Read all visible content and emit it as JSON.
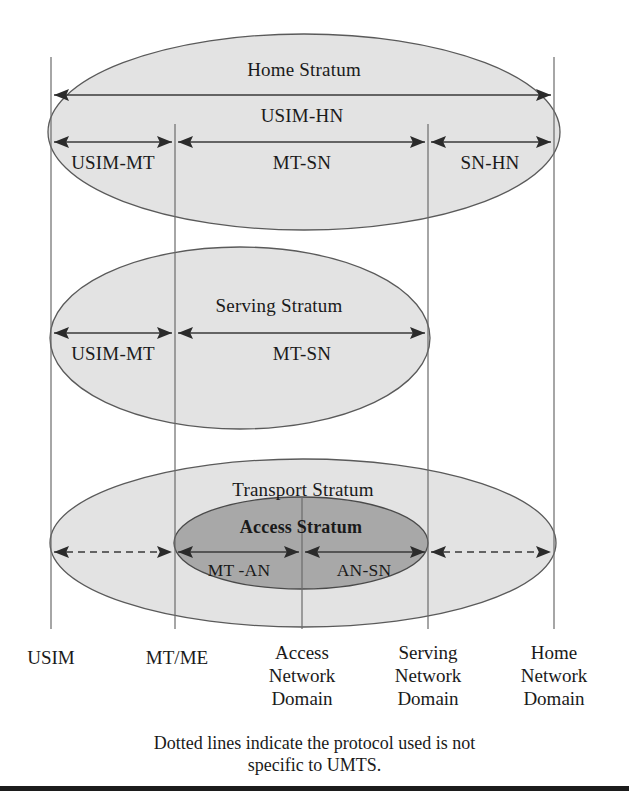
{
  "figure": {
    "type": "diagram",
    "colors": {
      "page_background": "#ffffff",
      "outer_ellipse_fill": "#e3e3e3",
      "inner_ellipse_fill": "#a8a8a8",
      "ellipse_stroke": "#555555",
      "line": "#3a3a3a",
      "text": "#1a1a1a",
      "rule": "#1c1c1c"
    }
  },
  "strata": [
    {
      "id": "home",
      "label": "Home Stratum",
      "fill": "#e3e3e3"
    },
    {
      "id": "serving",
      "label": "Serving Stratum",
      "fill": "#e3e3e3"
    },
    {
      "id": "transport",
      "label": "Transport Stratum",
      "fill": "#e3e3e3"
    },
    {
      "id": "access",
      "label": "Access Stratum",
      "fill": "#a8a8a8"
    }
  ],
  "interfaces": {
    "home": [
      {
        "id": "usim-hn",
        "label": "USIM-HN",
        "from": "USIM",
        "to": "Home Network Domain",
        "style": "solid"
      },
      {
        "id": "usim-mt",
        "label": "USIM-MT",
        "from": "USIM",
        "to": "MT/ME",
        "style": "solid"
      },
      {
        "id": "mt-sn",
        "label": "MT-SN",
        "from": "MT/ME",
        "to": "Serving Network Domain",
        "style": "solid"
      },
      {
        "id": "sn-hn",
        "label": "SN-HN",
        "from": "Serving Network Domain",
        "to": "Home Network Domain",
        "style": "solid"
      }
    ],
    "serving": [
      {
        "id": "usim-mt-s",
        "label": "USIM-MT",
        "from": "USIM",
        "to": "MT/ME",
        "style": "solid"
      },
      {
        "id": "mt-sn-s",
        "label": "MT-SN",
        "from": "MT/ME",
        "to": "Serving Network Domain",
        "style": "solid"
      }
    ],
    "transport": [
      {
        "id": "usim-mt-t",
        "label": "",
        "from": "USIM",
        "to": "MT/ME",
        "style": "dotted"
      },
      {
        "id": "mt-an",
        "label": "MT -AN",
        "from": "MT/ME",
        "to": "Access Network Domain",
        "style": "solid"
      },
      {
        "id": "an-sn",
        "label": "AN-SN",
        "from": "Access Network Domain",
        "to": "Serving Network Domain",
        "style": "solid"
      },
      {
        "id": "sn-hn-t",
        "label": "",
        "from": "Serving Network Domain",
        "to": "Home Network Domain",
        "style": "dotted"
      }
    ]
  },
  "domains": [
    {
      "id": "usim",
      "lines": [
        "USIM"
      ]
    },
    {
      "id": "mtme",
      "lines": [
        "MT/ME"
      ]
    },
    {
      "id": "access",
      "lines": [
        "Access",
        "Network",
        "Domain"
      ]
    },
    {
      "id": "serving",
      "lines": [
        "Serving",
        "Network",
        "Domain"
      ]
    },
    {
      "id": "home",
      "lines": [
        "Home",
        "Network",
        "Domain"
      ]
    }
  ],
  "caption": {
    "line1": "Dotted lines indicate the protocol used is not",
    "line2": "specific to UMTS."
  }
}
